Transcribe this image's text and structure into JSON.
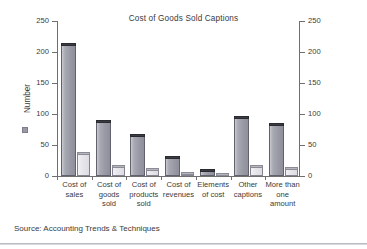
{
  "chart_data": {
    "type": "bar",
    "title": "Cost of Goods Sold Captions",
    "xlabel": "",
    "ylabel": "Number",
    "ylim": [
      0,
      250
    ],
    "yticks": [
      0,
      50,
      100,
      150,
      200,
      250
    ],
    "right_axis": true,
    "right_ylim": [
      0,
      250
    ],
    "right_yticks": [
      0,
      50,
      100,
      150,
      200,
      250
    ],
    "grid": false,
    "legend": [
      "Number"
    ],
    "legend_position": "y-axis-label",
    "categories": [
      "Cost of\nsales",
      "Cost of\ngoods\nsold",
      "Cost of\nproducts\nsold",
      "Cost of\nrevenues",
      "Elements\nof cost",
      "Other\ncaptions",
      "More than\none\namount"
    ],
    "series": [
      {
        "name": "Number",
        "values": [
          215,
          90,
          67,
          33,
          11,
          96,
          86
        ]
      },
      {
        "name": "Second",
        "values": [
          39,
          18,
          13,
          7,
          4,
          18,
          15
        ]
      }
    ],
    "colors": {
      "series_1": "#9a9aa6",
      "series_1_cap": "#3b3b44",
      "series_2": "#e6e6eb",
      "series_2_cap": "#b6b6bf",
      "axis": "#6f6f6f",
      "text": "#3a3a3a"
    }
  },
  "axis": {
    "left_ticks": [
      "250",
      "200",
      "150",
      "100",
      "50",
      "0"
    ],
    "right_ticks": [
      "250",
      "200",
      "150",
      "100",
      "50",
      "0"
    ]
  },
  "footer": {
    "source": "Source: Accounting Trends & Techniques"
  }
}
